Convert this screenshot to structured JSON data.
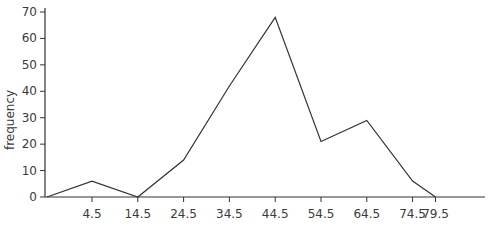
{
  "chart_data": {
    "type": "line",
    "title": "",
    "xlabel": "",
    "ylabel": "frequency",
    "x": [
      -0.5,
      4.5,
      14.5,
      24.5,
      34.5,
      44.5,
      54.5,
      64.5,
      74.5,
      79.5
    ],
    "x_tick_labels": [
      "4.5",
      "14.5",
      "24.5",
      "34.5",
      "44.5",
      "54.5",
      "64.5",
      "74.5",
      "79.5"
    ],
    "y_ticks": [
      0,
      10,
      20,
      30,
      40,
      50,
      60,
      70
    ],
    "series": [
      {
        "name": "frequency",
        "values": [
          0,
          6,
          0,
          14,
          42,
          68,
          21,
          29,
          6,
          0
        ]
      }
    ],
    "ylim": [
      0,
      70
    ],
    "grid": false,
    "legend": "none",
    "line_color": "#333333"
  }
}
